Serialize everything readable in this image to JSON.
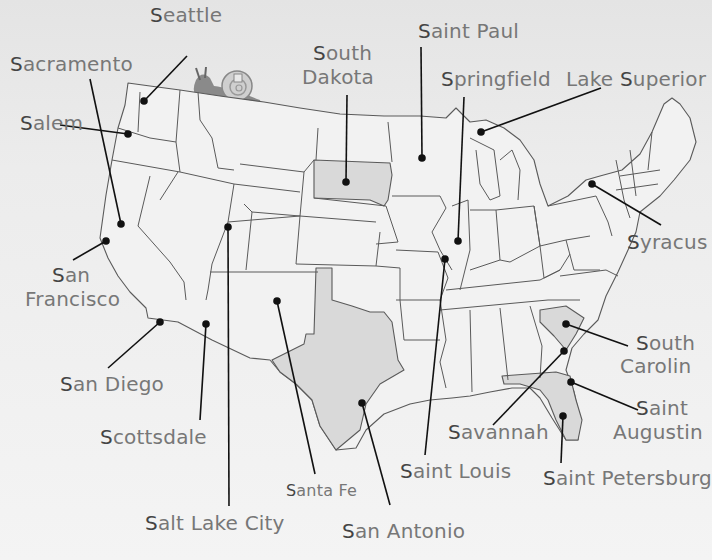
{
  "map": {
    "title": "United States cities beginning with S",
    "highlight_color": "#d9d9d9",
    "highlighted_states": [
      "South Dakota",
      "South Carolina",
      "Florida",
      "Texas"
    ],
    "decoration": "snail-icon"
  },
  "labels": [
    {
      "id": "seattle",
      "first": "S",
      "rest": "eattle",
      "x": 150,
      "y": 4
    },
    {
      "id": "sacramento",
      "first": "S",
      "rest": "acramento",
      "x": 10,
      "y": 53
    },
    {
      "id": "salem",
      "first": "S",
      "rest": "alem",
      "x": 20,
      "y": 112
    },
    {
      "id": "south-dakota-1",
      "first": "S",
      "rest": "outh",
      "x": 313,
      "y": 42
    },
    {
      "id": "south-dakota-2",
      "first": "",
      "rest": "Dakota",
      "x": 302,
      "y": 66
    },
    {
      "id": "saint-paul",
      "first": "S",
      "rest": "aint Paul",
      "x": 418,
      "y": 20
    },
    {
      "id": "springfield",
      "first": "S",
      "rest": "pringfield",
      "x": 441,
      "y": 68
    },
    {
      "id": "lake-superior",
      "first": "",
      "rest": "Lake ",
      "first2": "S",
      "rest2": "uperior",
      "x": 566,
      "y": 68
    },
    {
      "id": "syracuse",
      "first": "S",
      "rest": "yracus",
      "x": 627,
      "y": 231
    },
    {
      "id": "san-francisco-1",
      "first": "S",
      "rest": "an",
      "x": 52,
      "y": 264
    },
    {
      "id": "san-francisco-2",
      "first": "",
      "rest": "Francisco",
      "x": 25,
      "y": 288
    },
    {
      "id": "san-diego",
      "first": "S",
      "rest": "an Diego",
      "x": 60,
      "y": 373
    },
    {
      "id": "scottsdale",
      "first": "S",
      "rest": "cottsdale",
      "x": 100,
      "y": 426
    },
    {
      "id": "south-carolina-1",
      "first": "S",
      "rest": "outh",
      "x": 636,
      "y": 332
    },
    {
      "id": "south-carolina-2",
      "first": "",
      "rest": "Carolin",
      "x": 620,
      "y": 355
    },
    {
      "id": "saint-augustine-1",
      "first": "S",
      "rest": "aint",
      "x": 636,
      "y": 397
    },
    {
      "id": "saint-augustine-2",
      "first": "",
      "rest": "Augustin",
      "x": 613,
      "y": 421
    },
    {
      "id": "savannah",
      "first": "S",
      "rest": "avannah",
      "x": 448,
      "y": 421
    },
    {
      "id": "saint-louis",
      "first": "S",
      "rest": "aint Louis",
      "x": 400,
      "y": 460
    },
    {
      "id": "saint-petersburg",
      "first": "S",
      "rest": "aint Petersburg",
      "x": 543,
      "y": 467
    },
    {
      "id": "santa-fe",
      "first": "S",
      "rest": "anta Fe",
      "x": 286,
      "y": 480,
      "small": true
    },
    {
      "id": "salt-lake-city",
      "first": "S",
      "rest": "alt Lake City",
      "x": 145,
      "y": 512
    },
    {
      "id": "san-antonio",
      "first": "S",
      "rest": "an Antonio",
      "x": 342,
      "y": 520
    }
  ],
  "points": [
    {
      "name": "Seattle",
      "dot": [
        144,
        101
      ],
      "anchor": [
        187,
        56
      ]
    },
    {
      "name": "Sacramento",
      "dot": [
        121,
        224
      ],
      "anchor": [
        90,
        79
      ]
    },
    {
      "name": "Salem",
      "dot": [
        128,
        134
      ],
      "anchor": [
        60,
        125
      ]
    },
    {
      "name": "South Dakota",
      "dot": [
        346,
        182
      ],
      "anchor": [
        347,
        95
      ]
    },
    {
      "name": "Saint Paul",
      "dot": [
        422,
        158
      ],
      "anchor": [
        421,
        47
      ]
    },
    {
      "name": "Springfield",
      "dot": [
        458,
        241
      ],
      "anchor": [
        464,
        97
      ]
    },
    {
      "name": "Lake Superior",
      "dot": [
        481,
        132
      ],
      "anchor": [
        601,
        88
      ]
    },
    {
      "name": "Syracuse",
      "dot": [
        592,
        184
      ],
      "anchor": [
        661,
        225
      ]
    },
    {
      "name": "San Francisco",
      "dot": [
        106,
        241
      ],
      "anchor": [
        73,
        260
      ]
    },
    {
      "name": "San Diego",
      "dot": [
        160,
        322
      ],
      "anchor": [
        108,
        368
      ]
    },
    {
      "name": "Scottsdale",
      "dot": [
        206,
        324
      ],
      "anchor": [
        200,
        420
      ]
    },
    {
      "name": "Salt Lake City",
      "dot": [
        228,
        227
      ],
      "anchor": [
        229,
        506
      ]
    },
    {
      "name": "Santa Fe",
      "dot": [
        277,
        301
      ],
      "anchor": [
        315,
        474
      ]
    },
    {
      "name": "San Antonio",
      "dot": [
        362,
        403
      ],
      "anchor": [
        390,
        505
      ]
    },
    {
      "name": "Saint Louis",
      "dot": [
        445,
        259
      ],
      "anchor": [
        425,
        455
      ]
    },
    {
      "name": "South Carolina",
      "dot": [
        566,
        324
      ],
      "anchor": [
        628,
        346
      ]
    },
    {
      "name": "Savannah",
      "dot": [
        564,
        351
      ],
      "anchor": [
        493,
        425
      ]
    },
    {
      "name": "Saint Augustine",
      "dot": [
        571,
        382
      ],
      "anchor": [
        638,
        410
      ]
    },
    {
      "name": "Saint Petersburg",
      "dot": [
        563,
        416
      ],
      "anchor": [
        561,
        463
      ]
    }
  ]
}
